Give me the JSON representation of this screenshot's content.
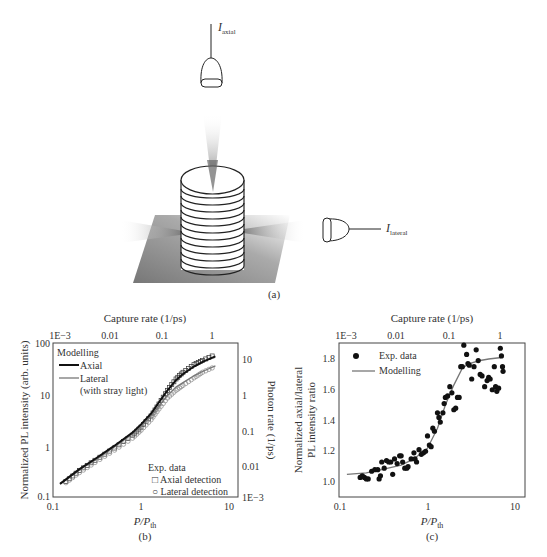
{
  "panel_a": {
    "label": "(a)",
    "axial_detector_label": {
      "main": "I",
      "sub": "axial"
    },
    "lateral_detector_label": {
      "main": "I",
      "sub": "lateral"
    }
  },
  "chart_data": [
    {
      "id": "b",
      "type": "line",
      "panel_label": "(b)",
      "title": "",
      "xlabel": "P/P_th",
      "ylabel": "Normalized PL intensity (arb. units)",
      "y2label": "Photon rate (1/ps)",
      "x2label": "Capture rate (1/ps)",
      "xscale": "log",
      "yscale": "log",
      "xlim": [
        0.1,
        10
      ],
      "ylim": [
        0.1,
        100
      ],
      "xticks": [
        "0.1",
        "1",
        "10"
      ],
      "yticks": [
        "0.1",
        "1",
        "10",
        "100"
      ],
      "x2ticks": [
        "1E−3",
        "0.01",
        "0.1",
        "1"
      ],
      "y2ticks": [
        "1E−3",
        "0.01",
        "0.1",
        "1",
        "10"
      ],
      "legend_model": {
        "title": "Modelling",
        "items": [
          "Axial",
          "Lateral",
          "(with stray light)"
        ]
      },
      "legend_exp": {
        "title": "Exp. data",
        "items": [
          "□ Axial detection",
          "○ Lateral detection"
        ]
      },
      "series": [
        {
          "name": "Modelling Axial",
          "x": [
            0.12,
            0.2,
            0.3,
            0.5,
            0.8,
            1.0,
            1.3,
            1.6,
            2.0,
            2.5,
            3.0,
            4.0,
            5.0,
            7.0
          ],
          "y": [
            0.18,
            0.35,
            0.55,
            1.0,
            1.8,
            2.6,
            4.2,
            7.0,
            12,
            19,
            25,
            35,
            43,
            55
          ]
        },
        {
          "name": "Modelling Lateral (with stray light)",
          "x": [
            0.12,
            0.2,
            0.3,
            0.5,
            0.8,
            1.0,
            1.3,
            1.6,
            2.0,
            2.5,
            3.0,
            4.0,
            5.0,
            7.0
          ],
          "y": [
            0.18,
            0.34,
            0.52,
            0.95,
            1.7,
            2.4,
            3.8,
            6.0,
            9.5,
            14,
            17,
            23,
            28,
            36
          ]
        },
        {
          "name": "Exp. Axial detection",
          "x": [
            0.14,
            0.2,
            0.3,
            0.5,
            0.8,
            1.0,
            1.3,
            1.6,
            2.0,
            2.5,
            3.0,
            4.0,
            5.0,
            7.0
          ],
          "y": [
            0.2,
            0.33,
            0.52,
            0.9,
            1.6,
            2.3,
            3.8,
            6.5,
            12,
            20,
            27,
            38,
            46,
            60
          ]
        },
        {
          "name": "Exp. Lateral detection",
          "x": [
            0.14,
            0.2,
            0.3,
            0.5,
            0.8,
            1.0,
            1.3,
            1.6,
            2.0,
            2.5,
            3.0,
            4.0,
            5.0,
            7.0
          ],
          "y": [
            0.19,
            0.3,
            0.47,
            0.82,
            1.4,
            2.0,
            3.2,
            5.2,
            8.5,
            12,
            15,
            21,
            27,
            35
          ]
        }
      ]
    },
    {
      "id": "c",
      "type": "scatter",
      "panel_label": "(c)",
      "title": "",
      "xlabel": "P/P_th",
      "ylabel": "Normalized axial/lateral PL intensity ratio",
      "x2label": "Capture rate (1/ps)",
      "xscale": "log",
      "yscale": "linear",
      "xlim": [
        0.1,
        10
      ],
      "ylim": [
        0.9,
        1.9
      ],
      "xticks": [
        "0.1",
        "1",
        "10"
      ],
      "yticks": [
        "1.0",
        "1.2",
        "1.4",
        "1.6",
        "1.8"
      ],
      "x2ticks": [
        "1E−3",
        "0.01",
        "0.1",
        "1"
      ],
      "legend": {
        "items": [
          "Exp. data",
          "Modelling"
        ]
      },
      "series": [
        {
          "name": "Modelling",
          "x": [
            0.12,
            0.2,
            0.3,
            0.5,
            0.7,
            1.0,
            1.3,
            1.6,
            2.0,
            2.5,
            3.0,
            4.0,
            5.0,
            7.0
          ],
          "y": [
            1.05,
            1.06,
            1.08,
            1.11,
            1.15,
            1.22,
            1.35,
            1.5,
            1.63,
            1.74,
            1.77,
            1.79,
            1.8,
            1.81
          ]
        },
        {
          "name": "Exp. data",
          "x": [
            0.17,
            0.18,
            0.19,
            0.2,
            0.21,
            0.23,
            0.25,
            0.27,
            0.28,
            0.29,
            0.3,
            0.32,
            0.34,
            0.36,
            0.38,
            0.4,
            0.42,
            0.45,
            0.48,
            0.5,
            0.52,
            0.55,
            0.58,
            0.6,
            0.65,
            0.7,
            0.72,
            0.75,
            0.8,
            0.85,
            0.9,
            0.95,
            1.0,
            1.05,
            1.1,
            1.15,
            1.2,
            1.3,
            1.35,
            1.4,
            1.5,
            1.55,
            1.6,
            1.7,
            1.8,
            1.9,
            2.0,
            2.1,
            2.2,
            2.3,
            2.4,
            2.5,
            2.6,
            2.8,
            2.9,
            3.0,
            3.2,
            3.4,
            3.6,
            3.8,
            4.0,
            4.2,
            4.5,
            4.8,
            5.0,
            5.2,
            5.5,
            5.8,
            6.0,
            6.2,
            6.5,
            6.8,
            7.0,
            7.2,
            7.3
          ],
          "y": [
            1.03,
            1.04,
            1.03,
            1.02,
            1.02,
            1.07,
            1.08,
            1.08,
            1.02,
            1.04,
            1.13,
            1.09,
            1.14,
            1.13,
            1.13,
            1.05,
            1.15,
            1.12,
            1.17,
            1.17,
            1.13,
            1.09,
            1.09,
            1.1,
            1.15,
            1.19,
            1.15,
            1.13,
            1.21,
            1.18,
            1.19,
            1.2,
            1.3,
            1.24,
            1.23,
            1.35,
            1.33,
            1.45,
            1.42,
            1.39,
            1.45,
            1.51,
            1.55,
            1.56,
            1.62,
            1.58,
            1.47,
            1.48,
            1.55,
            1.55,
            1.75,
            1.75,
            1.89,
            1.83,
            1.77,
            1.76,
            1.67,
            1.75,
            1.86,
            1.79,
            1.7,
            1.69,
            1.62,
            1.66,
            1.68,
            1.67,
            1.6,
            1.75,
            1.62,
            1.59,
            1.61,
            1.87,
            1.82,
            1.75,
            1.72
          ]
        }
      ]
    }
  ]
}
